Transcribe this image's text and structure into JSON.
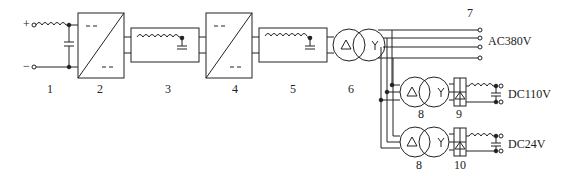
{
  "diagram": {
    "type": "power-supply-block-diagram",
    "input": {
      "plus": "+",
      "minus": "−"
    },
    "block_labels": [
      "1",
      "2",
      "3",
      "4",
      "5",
      "6",
      "7",
      "8",
      "9",
      "8",
      "10"
    ],
    "outputs": {
      "ac": "AC380V",
      "dc1": "DC110V",
      "dc2": "DC24V"
    },
    "colors": {
      "line": "#222222",
      "background": "#ffffff"
    }
  }
}
